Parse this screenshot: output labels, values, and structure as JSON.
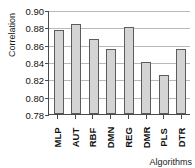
{
  "chart_data": {
    "type": "bar",
    "title": "",
    "xlabel": "Algorithms",
    "ylabel": "Correlation",
    "categories": [
      "MLP",
      "AUT",
      "RBF",
      "DMN",
      "REG",
      "DMR",
      "PLS",
      "DTR"
    ],
    "values": [
      0.8775,
      0.8835,
      0.867,
      0.8545,
      0.8805,
      0.8405,
      0.8245,
      0.855
    ],
    "ylim": [
      0.78,
      0.9
    ],
    "yticks": [
      0.9,
      0.88,
      0.86,
      0.84,
      0.82,
      0.8,
      0.78
    ],
    "ytick_labels": [
      "0.90",
      "0.88",
      "0.86",
      "0.84",
      "0.82",
      "0.80",
      "0.78"
    ],
    "grid": true,
    "legend": false,
    "bar_color": "#d4d4d4",
    "bar_edge_color": "#5c5c5c",
    "grid_color": "#b9b9b9",
    "axis_color": "#4a4a4a"
  }
}
